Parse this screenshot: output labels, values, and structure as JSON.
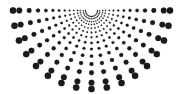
{
  "figure": {
    "width": 183,
    "height": 94,
    "background": "#ffffff",
    "title": ""
  },
  "chart_data": {
    "type": "scatter",
    "title": "",
    "subtitle": "",
    "xlabel": "",
    "ylabel": "",
    "xlim": [
      0,
      183
    ],
    "ylim": [
      0,
      94
    ],
    "grid": false,
    "legend": null,
    "axes_visible": false,
    "tick_labels_x": [],
    "tick_labels_y": [],
    "coordinate_system": "polar",
    "origin": {
      "x": 91.5,
      "y": 10.5
    },
    "angular_range_deg": [
      0,
      180
    ],
    "angular_steps": 17,
    "radial_steps": 13,
    "radius_min": 6,
    "radius_max": 78.5,
    "radius_scale": "geometric",
    "radius_values": [
      6.0,
      8.3,
      11.3,
      14.0,
      17.8,
      22.0,
      26.8,
      32.4,
      38.6,
      45.6,
      53.5,
      62.3,
      72.2,
      78.5
    ],
    "marker": {
      "shape": "circle",
      "color": "#1a1a1a",
      "edge_color": "#1a1a1a",
      "size_min": 0.55,
      "size_max": 3.2,
      "size_scale": "proportional-to-radius"
    },
    "annotations": []
  }
}
